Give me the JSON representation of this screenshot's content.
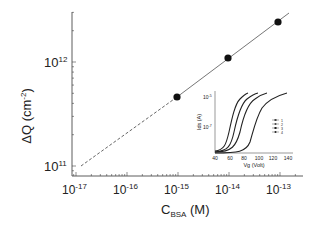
{
  "chart_data": [
    {
      "type": "scatter",
      "title": "",
      "xlabel": "C",
      "xlabel_sub": "BSA",
      "xlabel_unit": "(M)",
      "ylabel": "ΔQ (cm",
      "ylabel_sup": "-2",
      "ylabel_close": ")",
      "xscale": "log",
      "yscale": "log",
      "xlim": [
        7e-18,
        2.8e-13
      ],
      "ylim": [
        8e-11,
        4000000000000.0
      ],
      "x_ticks": [
        {
          "base": "10",
          "exp": "-17",
          "value": 1e-17
        },
        {
          "base": "10",
          "exp": "-16",
          "value": 1e-16
        },
        {
          "base": "10",
          "exp": "-15",
          "value": 1e-15
        },
        {
          "base": "10",
          "exp": "-14",
          "value": 1e-14
        },
        {
          "base": "10",
          "exp": "-13",
          "value": 1e-13
        }
      ],
      "y_ticks": [
        {
          "base": "10",
          "exp": "11",
          "value": 100000000000.0
        },
        {
          "base": "10",
          "exp": "12",
          "value": 1000000000000.0
        }
      ],
      "grid": false,
      "series": [
        {
          "name": "measured",
          "marker": "filled-circle",
          "x": [
            1e-15,
            1e-14,
            1e-13
          ],
          "y": [
            460000000000.0,
            1100000000000.0,
            2400000000000.0
          ]
        },
        {
          "name": "fit",
          "style": "solid",
          "x": [
            1e-15,
            1.6e-13
          ],
          "y": [
            460000000000.0,
            2900000000000.0
          ]
        },
        {
          "name": "extrapolation",
          "style": "dashed",
          "x": [
            1.25e-17,
            1e-15
          ],
          "y": [
            100000000000.0,
            460000000000.0
          ]
        }
      ]
    },
    {
      "type": "line",
      "title": "inset",
      "xlabel": "Vg (Volt)",
      "ylabel": "Ids (A)",
      "yscale": "log",
      "x_ticks": [
        "40",
        "60",
        "80",
        "100",
        "120",
        "140"
      ],
      "y_ticks": [
        {
          "base": "10",
          "exp": "-5"
        },
        {
          "base": "10",
          "exp": "-7"
        }
      ],
      "legend": [
        "1",
        "2",
        "3",
        "4"
      ],
      "legend_position": "right",
      "series": [
        {
          "name": "1",
          "x": [
            40,
            50,
            55,
            60,
            65,
            70,
            75,
            80
          ],
          "y_rel": [
            0.02,
            0.05,
            0.2,
            0.5,
            0.72,
            0.86,
            0.93,
            0.97
          ]
        },
        {
          "name": "2",
          "x": [
            40,
            55,
            60,
            65,
            70,
            75,
            80,
            90
          ],
          "y_rel": [
            0.02,
            0.05,
            0.2,
            0.5,
            0.72,
            0.86,
            0.93,
            0.97
          ]
        },
        {
          "name": "3",
          "x": [
            40,
            60,
            65,
            70,
            75,
            80,
            90,
            100
          ],
          "y_rel": [
            0.02,
            0.05,
            0.2,
            0.5,
            0.72,
            0.86,
            0.93,
            0.97
          ]
        },
        {
          "name": "4",
          "x": [
            40,
            80,
            85,
            95,
            100,
            110,
            120,
            135
          ],
          "y_rel": [
            0.02,
            0.05,
            0.2,
            0.5,
            0.72,
            0.86,
            0.93,
            0.97
          ]
        }
      ]
    }
  ],
  "main": {
    "ylabel": "ΔQ (cm",
    "ylabel_sup": "-2",
    "ylabel_close": ")",
    "xlabel": "C",
    "xlabel_sub": "BSA",
    "xlabel_unit": " (M)",
    "x_tick_base": "10",
    "x_tick_exps": [
      "-17",
      "-16",
      "-15",
      "-14",
      "-13"
    ],
    "y_tick_base": "10",
    "y_tick_exps": [
      "11",
      "12"
    ]
  },
  "inset": {
    "xlabel": "Vg (Volt)",
    "ylabel": "Ids (A)",
    "x_ticks": [
      "40",
      "60",
      "80",
      "100",
      "120",
      "140"
    ],
    "y_tick_exps": [
      "-5",
      "-7"
    ],
    "legend": [
      "1",
      "2",
      "3",
      "4"
    ]
  }
}
